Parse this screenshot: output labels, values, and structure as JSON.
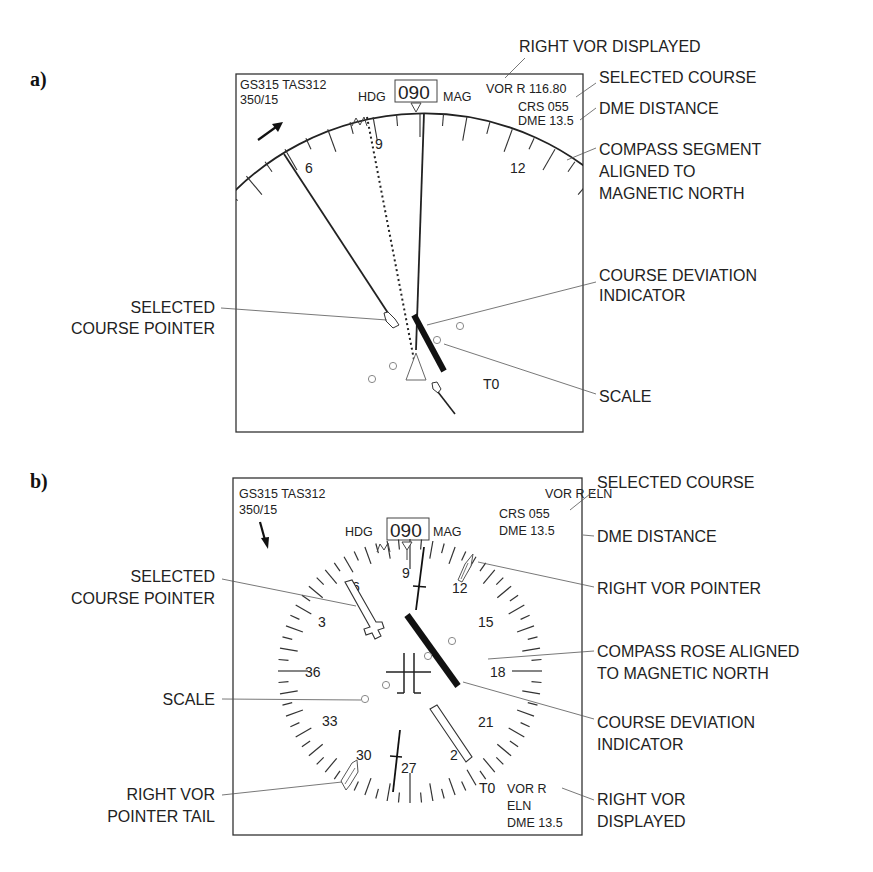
{
  "figure": {
    "panels": [
      {
        "letter": "a)",
        "mode": "expanded VOR (arc)",
        "display": {
          "gs_tas": "GS315 TAS312",
          "wind": "350/15",
          "hdg_label": "HDG",
          "hdg_value": "090",
          "mag_label": "MAG",
          "vor_line": "VOR R 116.80",
          "crs_line": "CRS 055",
          "dme_line": "DME 13.5",
          "to_from": "T0",
          "compass_numbers": [
            "6",
            "9",
            "12"
          ]
        },
        "annotations": {
          "right_vor_displayed": "RIGHT VOR DISPLAYED",
          "selected_course": "SELECTED COURSE",
          "dme_distance": "DME DISTANCE",
          "compass_segment": [
            "COMPASS SEGMENT",
            "ALIGNED TO",
            "MAGNETIC NORTH"
          ],
          "selected_course_pointer": [
            "SELECTED",
            "COURSE POINTER"
          ],
          "course_deviation_indicator": [
            "COURSE DEVIATION",
            "INDICATOR"
          ],
          "scale": "SCALE"
        }
      },
      {
        "letter": "b)",
        "mode": "full VOR (rose)",
        "display": {
          "gs_tas": "GS315 TAS312",
          "wind": "350/15",
          "hdg_label": "HDG",
          "hdg_value": "090",
          "mag_label": "MAG",
          "vor_line": "VOR R ELN",
          "crs_line": "CRS 055",
          "dme_line": "DME 13.5",
          "to_from": "T0",
          "bottom_vor": [
            "VOR R",
            "ELN",
            "DME 13.5"
          ],
          "compass_numbers": [
            "9",
            "12",
            "15",
            "18",
            "21",
            "2",
            "27",
            "30",
            "33",
            "36",
            "3",
            "6"
          ]
        },
        "annotations": {
          "selected_course": "SELECTED COURSE",
          "dme_distance": "DME DISTANCE",
          "right_vor_pointer": "RIGHT VOR POINTER",
          "compass_rose": [
            "COMPASS ROSE ALIGNED",
            "TO MAGNETIC NORTH"
          ],
          "course_deviation_indicator": [
            "COURSE DEVIATION",
            "INDICATOR"
          ],
          "right_vor_displayed": [
            "RIGHT VOR",
            "DISPLAYED"
          ],
          "selected_course_pointer": [
            "SELECTED",
            "COURSE POINTER"
          ],
          "scale": "SCALE",
          "right_vor_pointer_tail": [
            "RIGHT VOR",
            "POINTER TAIL"
          ]
        }
      }
    ]
  },
  "colors": {
    "ink": "#222222",
    "background": "#ffffff",
    "scale_dot": "#888888"
  }
}
